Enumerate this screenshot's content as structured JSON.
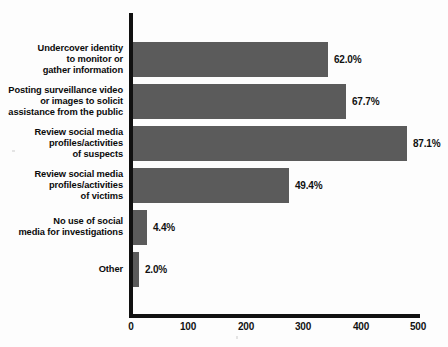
{
  "chart_data": {
    "type": "bar",
    "orientation": "horizontal",
    "title": "",
    "subtitle": "",
    "xlabel": "",
    "ylabel": "",
    "grid": false,
    "legend": false,
    "xlim": [
      0,
      500
    ],
    "xticks": [
      0,
      100,
      200,
      300,
      400,
      500
    ],
    "xtick_labels": [
      "0",
      "100",
      "200",
      "300",
      "400",
      "500"
    ],
    "bar_color": "#5b5b5b",
    "axis_color": "#111111",
    "background_color": "#fdfdfd",
    "categories": [
      "Undercover identity\nto monitor or\ngather information",
      "Posting surveillance video\nor images to solicit\nassistance from the public",
      "Review social media\nprofiles/activities\nof suspects",
      "Review social media\nprofiles/activities\nof victims",
      "No use of social\nmedia for investigations",
      "Other"
    ],
    "values": [
      340,
      371,
      477,
      271,
      24,
      11
    ],
    "data_labels": [
      "62.0%",
      "67.7%",
      "87.1%",
      "49.4%",
      "4.4%",
      "2.0%"
    ],
    "percent_values": [
      62.0,
      67.7,
      87.1,
      49.4,
      4.4,
      2.0
    ]
  }
}
